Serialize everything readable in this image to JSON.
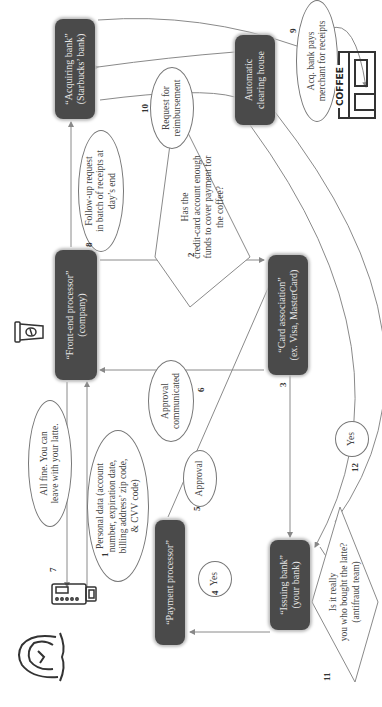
{
  "diagram": {
    "orientation": "rotated 90 degrees counter-clockwise",
    "colors": {
      "box_fill": "#4a4a4a",
      "box_text": "#e6e6e6",
      "line": "#888888",
      "text": "#444444"
    },
    "nodes": {
      "front_end_processor": {
        "line1": "“Front-end processor”",
        "line2": "(company)"
      },
      "acquiring_bank": {
        "line1": "“Acquiring bank”",
        "line2": "(Starbucks’ bank)"
      },
      "automatic_clearing_house": {
        "line1": "Automatic",
        "line2": "clearing house"
      },
      "card_association": {
        "line1": "“Card association”",
        "line2": "(ex. Visa, MasterCard)"
      },
      "payment_processor": {
        "line1": "“Payment processor”"
      },
      "issuing_bank": {
        "line1": "“Issuing bank”",
        "line2": "(your bank)"
      }
    },
    "labels": {
      "personal_data": {
        "lines": [
          "Personal data (account",
          "number, expiration date,",
          "billing address’ zip code,",
          "& CVV code)"
        ]
      },
      "all_fine": {
        "lines": [
          "All fine. You can",
          "leave with your latte."
        ]
      },
      "follow_up": {
        "lines": [
          "Follow-up request",
          "in batch of receipts at",
          "day’s end"
        ]
      },
      "request_reimbursement": {
        "lines": [
          "Request for",
          "reimbursement"
        ]
      },
      "acq_bank_pays": {
        "lines": [
          "Acq. bank pays",
          "merchant for receipts"
        ]
      },
      "approval_communicated": {
        "lines": [
          "Approval",
          "communicated"
        ]
      },
      "approval": {
        "lines": [
          "Approval"
        ]
      },
      "yes_4": {
        "lines": [
          "Yes"
        ]
      },
      "yes_12": {
        "lines": [
          "Yes"
        ]
      }
    },
    "decisions": {
      "enough_funds": {
        "lines": [
          "Has the",
          "credit-card account enough",
          "funds to cover payment for",
          "the coffee?"
        ]
      },
      "antifraud": {
        "lines": [
          "Is it really",
          "you who bought the latte?",
          "(antifraud team)"
        ]
      }
    },
    "step_numbers": {
      "s1": "1",
      "s2": "2",
      "s3": "3",
      "s4": "4",
      "s5": "5",
      "s6": "6",
      "s7": "7",
      "s8": "8",
      "s9": "9",
      "s10": "10",
      "s11": "11",
      "s12": "12"
    },
    "icons": {
      "coffee_shop_sign": "COFFEE",
      "customer": "person-icon",
      "terminal": "card-terminal-icon",
      "cup": "coffee-cup-icon",
      "shop": "coffee-shop-icon"
    }
  }
}
